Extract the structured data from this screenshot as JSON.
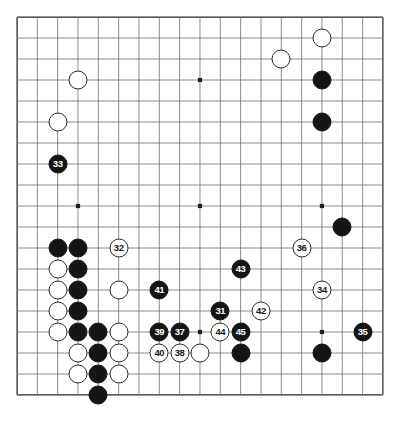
{
  "board": {
    "size": 19,
    "type": "go-board-diagram",
    "origin_x": 17,
    "origin_y": 17,
    "cell_w": 20.33,
    "cell_h": 21.0,
    "line_color": "#6f7072",
    "border_color": "#231f20",
    "black_color": "#151515",
    "white_color": "#ffffff",
    "background": "#ffffff",
    "star_points": [
      {
        "col": 3,
        "row": 3
      },
      {
        "col": 9,
        "row": 3
      },
      {
        "col": 15,
        "row": 3
      },
      {
        "col": 3,
        "row": 9
      },
      {
        "col": 9,
        "row": 9
      },
      {
        "col": 15,
        "row": 9
      },
      {
        "col": 3,
        "row": 15
      },
      {
        "col": 9,
        "row": 15
      },
      {
        "col": 15,
        "row": 15
      }
    ]
  },
  "stones": [
    {
      "id": "w-top-right-a",
      "color": "white",
      "col": 15,
      "row": 1,
      "label": ""
    },
    {
      "id": "w-top-right-b",
      "color": "white",
      "col": 13,
      "row": 2,
      "label": ""
    },
    {
      "id": "b-right-top-a",
      "color": "black",
      "col": 15,
      "row": 3,
      "label": ""
    },
    {
      "id": "b-right-top-b",
      "color": "black",
      "col": 15,
      "row": 5,
      "label": ""
    },
    {
      "id": "w-upper-left-a",
      "color": "white",
      "col": 3,
      "row": 3,
      "label": ""
    },
    {
      "id": "w-upper-left-b",
      "color": "white",
      "col": 2,
      "row": 5,
      "label": ""
    },
    {
      "id": "b-33",
      "color": "black",
      "col": 2,
      "row": 7,
      "label": "33"
    },
    {
      "id": "b-right-mid",
      "color": "black",
      "col": 16,
      "row": 10,
      "label": ""
    },
    {
      "id": "b-lc-a",
      "color": "black",
      "col": 2,
      "row": 11,
      "label": ""
    },
    {
      "id": "b-lc-b",
      "color": "black",
      "col": 3,
      "row": 11,
      "label": ""
    },
    {
      "id": "w-32",
      "color": "white",
      "col": 5,
      "row": 11,
      "label": "32"
    },
    {
      "id": "w-36",
      "color": "white",
      "col": 14,
      "row": 11,
      "label": "36"
    },
    {
      "id": "w-lc-c",
      "color": "white",
      "col": 2,
      "row": 12,
      "label": ""
    },
    {
      "id": "b-lc-d",
      "color": "black",
      "col": 3,
      "row": 12,
      "label": ""
    },
    {
      "id": "b-43",
      "color": "black",
      "col": 11,
      "row": 12,
      "label": "43"
    },
    {
      "id": "w-lc-e",
      "color": "white",
      "col": 2,
      "row": 13,
      "label": ""
    },
    {
      "id": "b-lc-f",
      "color": "black",
      "col": 3,
      "row": 13,
      "label": ""
    },
    {
      "id": "w-lc-g",
      "color": "white",
      "col": 5,
      "row": 13,
      "label": ""
    },
    {
      "id": "b-41",
      "color": "black",
      "col": 7,
      "row": 13,
      "label": "41"
    },
    {
      "id": "w-34",
      "color": "white",
      "col": 15,
      "row": 13,
      "label": "34"
    },
    {
      "id": "w-lc-h",
      "color": "white",
      "col": 2,
      "row": 14,
      "label": ""
    },
    {
      "id": "b-lc-i",
      "color": "black",
      "col": 3,
      "row": 14,
      "label": ""
    },
    {
      "id": "b-31",
      "color": "black",
      "col": 10,
      "row": 14,
      "label": "31"
    },
    {
      "id": "w-42",
      "color": "white",
      "col": 12,
      "row": 14,
      "label": "42"
    },
    {
      "id": "w-lc-j",
      "color": "white",
      "col": 2,
      "row": 15,
      "label": ""
    },
    {
      "id": "b-lc-k",
      "color": "black",
      "col": 3,
      "row": 15,
      "label": ""
    },
    {
      "id": "b-lc-l",
      "color": "black",
      "col": 4,
      "row": 15,
      "label": ""
    },
    {
      "id": "w-lc-m",
      "color": "white",
      "col": 5,
      "row": 15,
      "label": ""
    },
    {
      "id": "b-39",
      "color": "black",
      "col": 7,
      "row": 15,
      "label": "39"
    },
    {
      "id": "b-37",
      "color": "black",
      "col": 8,
      "row": 15,
      "label": "37"
    },
    {
      "id": "w-44",
      "color": "white",
      "col": 10,
      "row": 15,
      "label": "44"
    },
    {
      "id": "b-45",
      "color": "black",
      "col": 11,
      "row": 15,
      "label": "45"
    },
    {
      "id": "b-35",
      "color": "black",
      "col": 17,
      "row": 15,
      "label": "35"
    },
    {
      "id": "w-lc-n",
      "color": "white",
      "col": 3,
      "row": 16,
      "label": ""
    },
    {
      "id": "b-lc-o",
      "color": "black",
      "col": 4,
      "row": 16,
      "label": ""
    },
    {
      "id": "w-lc-p",
      "color": "white",
      "col": 5,
      "row": 16,
      "label": ""
    },
    {
      "id": "w-40",
      "color": "white",
      "col": 7,
      "row": 16,
      "label": "40"
    },
    {
      "id": "w-38",
      "color": "white",
      "col": 8,
      "row": 16,
      "label": "38"
    },
    {
      "id": "w-lc-q",
      "color": "white",
      "col": 9,
      "row": 16,
      "label": ""
    },
    {
      "id": "b-bot-45",
      "color": "black",
      "col": 11,
      "row": 16,
      "label": ""
    },
    {
      "id": "b-bot-right",
      "color": "black",
      "col": 15,
      "row": 16,
      "label": ""
    },
    {
      "id": "w-lc-r",
      "color": "white",
      "col": 3,
      "row": 17,
      "label": ""
    },
    {
      "id": "b-lc-s",
      "color": "black",
      "col": 4,
      "row": 17,
      "label": ""
    },
    {
      "id": "w-lc-t",
      "color": "white",
      "col": 5,
      "row": 17,
      "label": ""
    },
    {
      "id": "b-lc-u",
      "color": "black",
      "col": 4,
      "row": 18,
      "label": ""
    }
  ],
  "move_labels": [
    "31",
    "32",
    "33",
    "34",
    "35",
    "36",
    "37",
    "38",
    "39",
    "40",
    "41",
    "42",
    "43",
    "44",
    "45"
  ]
}
